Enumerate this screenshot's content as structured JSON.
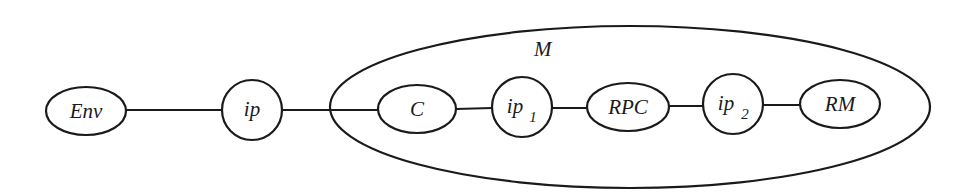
{
  "diagram": {
    "container": {
      "id": "M",
      "label": "M"
    },
    "nodes": [
      {
        "id": "env",
        "label": "Env",
        "sub": "",
        "shape": "ellipse"
      },
      {
        "id": "ip",
        "label": "ip",
        "sub": "",
        "shape": "circle"
      },
      {
        "id": "c",
        "label": "C",
        "sub": "",
        "shape": "ellipse"
      },
      {
        "id": "ip1",
        "label": "ip",
        "sub": "1",
        "shape": "circle"
      },
      {
        "id": "rpc",
        "label": "RPC",
        "sub": "",
        "shape": "ellipse"
      },
      {
        "id": "ip2",
        "label": "ip",
        "sub": "2",
        "shape": "circle"
      },
      {
        "id": "rm",
        "label": "RM",
        "sub": "",
        "shape": "ellipse"
      }
    ],
    "edges": [
      {
        "from": "Env",
        "to": "ip"
      },
      {
        "from": "ip",
        "to": "C"
      },
      {
        "from": "C",
        "to": "ip1"
      },
      {
        "from": "ip1",
        "to": "RPC"
      },
      {
        "from": "RPC",
        "to": "ip2"
      },
      {
        "from": "ip2",
        "to": "RM"
      }
    ],
    "colors": {
      "line": "#1a1a1a",
      "background": "#ffffff"
    }
  }
}
